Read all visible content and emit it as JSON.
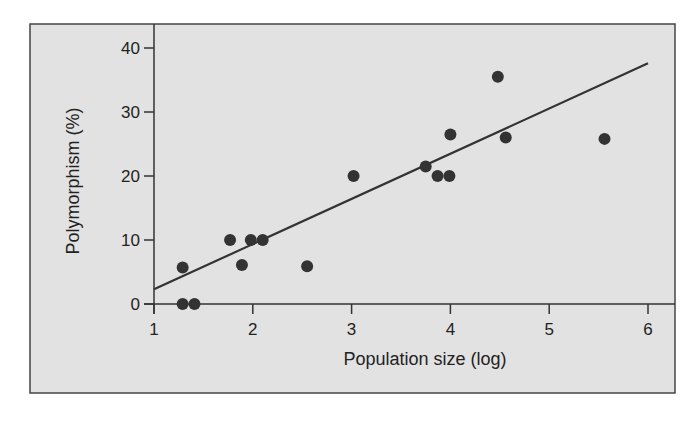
{
  "chart_data": {
    "type": "scatter",
    "title": "",
    "xlabel": "Population size (log)",
    "ylabel": "Polymorphism (%)",
    "xlim": [
      1,
      6
    ],
    "ylim": [
      0,
      40
    ],
    "x_ticks": [
      1,
      2,
      3,
      4,
      5,
      6
    ],
    "y_ticks": [
      0,
      10,
      20,
      30,
      40
    ],
    "grid": false,
    "legend": null,
    "series": [
      {
        "name": "populations",
        "type": "scatter",
        "points": [
          {
            "x": 1.29,
            "y": 5.7
          },
          {
            "x": 1.29,
            "y": 0
          },
          {
            "x": 1.41,
            "y": 0
          },
          {
            "x": 1.77,
            "y": 10
          },
          {
            "x": 1.89,
            "y": 6.1
          },
          {
            "x": 1.98,
            "y": 10
          },
          {
            "x": 2.1,
            "y": 10
          },
          {
            "x": 2.55,
            "y": 5.9
          },
          {
            "x": 3.02,
            "y": 20
          },
          {
            "x": 3.75,
            "y": 21.5
          },
          {
            "x": 3.87,
            "y": 20
          },
          {
            "x": 3.99,
            "y": 20
          },
          {
            "x": 4.0,
            "y": 26.5
          },
          {
            "x": 4.48,
            "y": 35.5
          },
          {
            "x": 4.56,
            "y": 26.0
          },
          {
            "x": 5.56,
            "y": 25.8
          }
        ]
      },
      {
        "name": "regression line",
        "type": "line",
        "points": [
          {
            "x": 1,
            "y": 2.3
          },
          {
            "x": 6,
            "y": 37.6
          }
        ]
      }
    ]
  },
  "colors": {
    "panel_background": "#e2e2e2",
    "panel_border": "#444444",
    "marker": "#333333",
    "line": "#333333",
    "axis": "#333333"
  }
}
